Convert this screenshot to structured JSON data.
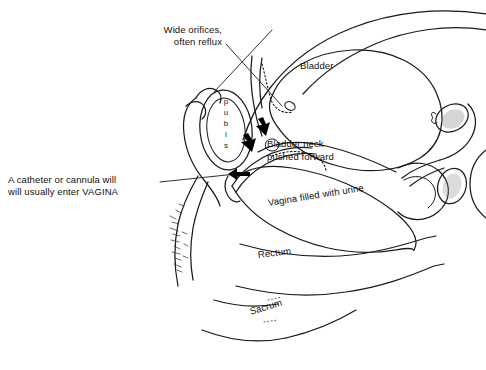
{
  "figure": {
    "type": "medical-line-diagram",
    "view": "sagittal section of female pelvis",
    "background_color": "#ffffff",
    "ink_color": "#1a1a1a"
  },
  "annotations": {
    "wide_orifices": {
      "line1": "Wide orifices,",
      "line2": "often reflux",
      "full": "Wide orifices, often reflux"
    },
    "catheter": {
      "line1": "A catheter or cannula will",
      "line2": "will usually enter VAGINA",
      "full": "A catheter or cannula will will usually enter VAGINA"
    },
    "bladder_neck": {
      "line1": "Bladder neck",
      "line2": "pushed forward",
      "full": "Bladder neck pushed forward"
    }
  },
  "structure_labels": {
    "bladder": "Bladder",
    "vagina_filled": "Vagina filled with urine",
    "rectum": "Rectum",
    "sacrum": "Sacrum",
    "pubis": "pubis",
    "pubis_letters": [
      "p",
      "u",
      "b",
      "i",
      "s"
    ]
  }
}
